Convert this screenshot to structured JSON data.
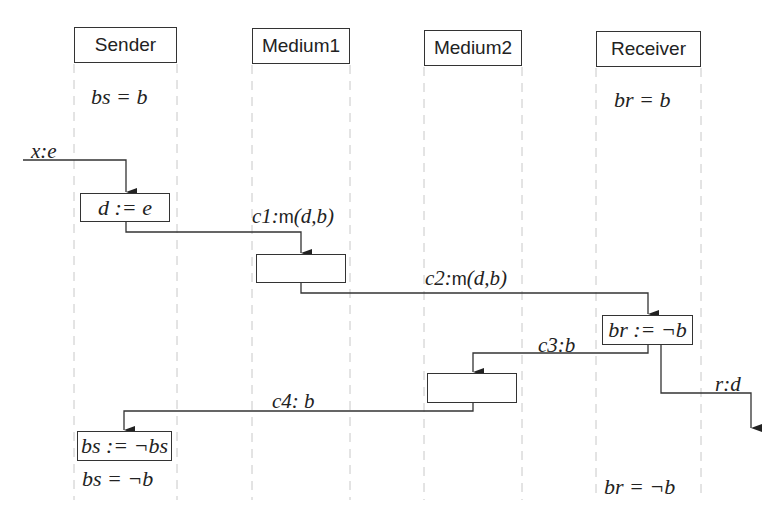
{
  "diagram": {
    "type": "sequence-diagram",
    "lifelines": [
      {
        "id": "sender",
        "label": "Sender",
        "initial_state": "bs = b",
        "final_state": "bs = ¬b"
      },
      {
        "id": "medium1",
        "label": "Medium1"
      },
      {
        "id": "medium2",
        "label": "Medium2"
      },
      {
        "id": "receiver",
        "label": "Receiver",
        "initial_state": "br = b",
        "final_state": "br = ¬b"
      }
    ],
    "actions": {
      "sender_assign": "d := e",
      "receiver_assign": "br := ¬b",
      "sender_toggle": "bs := ¬bs",
      "medium1_box": "",
      "medium2_box": ""
    },
    "messages": [
      {
        "id": "x",
        "channel": "x",
        "payload": "e",
        "label": "x:e",
        "from": "environment",
        "to": "sender"
      },
      {
        "id": "c1",
        "channel": "c1",
        "fn": "m",
        "args": "(d,b)",
        "from": "sender",
        "to": "medium1"
      },
      {
        "id": "c2",
        "channel": "c2",
        "fn": "m",
        "args": "(d,b)",
        "from": "medium1",
        "to": "receiver"
      },
      {
        "id": "c3",
        "channel": "c3",
        "payload": "b",
        "label": "c3:b",
        "from": "receiver",
        "to": "medium2"
      },
      {
        "id": "r",
        "channel": "r",
        "payload": "d",
        "label": "r:d",
        "from": "receiver",
        "to": "environment"
      },
      {
        "id": "c4",
        "channel": "c4",
        "payload": "b",
        "label": "c4: b",
        "from": "medium2",
        "to": "sender"
      }
    ],
    "colors": {
      "line": "#333333",
      "lifeline": "#c8c8c8",
      "text": "#222222",
      "background": "#ffffff"
    }
  }
}
